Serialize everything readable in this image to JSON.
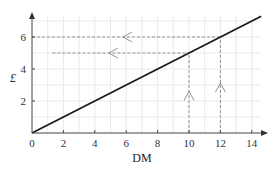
{
  "chart_data": {
    "type": "line",
    "title": "",
    "xlabel": "DM",
    "ylabel": "£",
    "xlim": [
      0,
      14.6
    ],
    "ylim": [
      0,
      7.3
    ],
    "x_ticks": [
      0,
      2,
      4,
      6,
      8,
      10,
      12,
      14
    ],
    "y_ticks": [
      2,
      4,
      6
    ],
    "grid": true,
    "series": [
      {
        "name": "exchange rate line",
        "x": [
          0,
          14.6
        ],
        "y": [
          0,
          7.3
        ],
        "color": "#1a1a1a"
      }
    ],
    "annotations": [
      {
        "type": "dashed-vertical",
        "x": 10,
        "from_y": 0,
        "to_y": 5,
        "arrow": "up"
      },
      {
        "type": "dashed-vertical",
        "x": 12,
        "from_y": 0,
        "to_y": 6,
        "arrow": "up"
      },
      {
        "type": "dashed-horizontal",
        "y": 5,
        "from_x": 1.3,
        "to_x": 10,
        "arrow": "left"
      },
      {
        "type": "dashed-horizontal",
        "y": 6,
        "from_x": 0,
        "to_x": 12,
        "arrow": "left"
      }
    ]
  },
  "labels": {
    "xlabel": "DM",
    "ylabel": "£",
    "x_ticks": [
      "0",
      "2",
      "4",
      "6",
      "8",
      "10",
      "12",
      "14"
    ],
    "y_ticks": [
      "2",
      "4",
      "6"
    ]
  },
  "colors": {
    "axis": "#444444",
    "grid": "#e4e4e4",
    "line": "#1a1a1a",
    "dashed": "#888888"
  }
}
